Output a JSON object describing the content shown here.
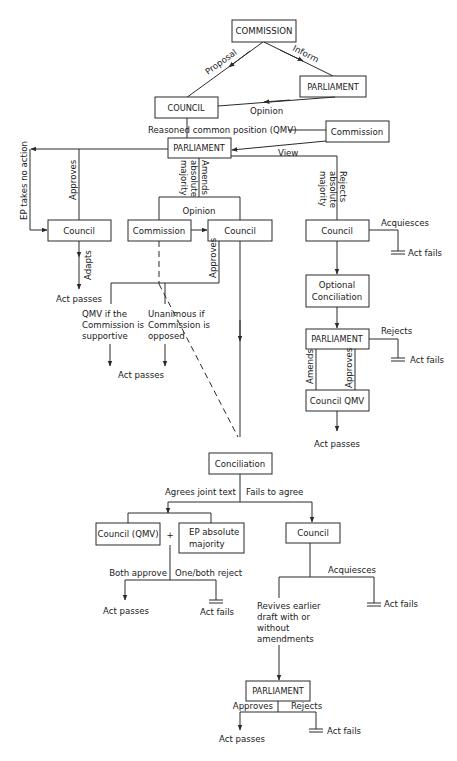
{
  "diagram": {
    "type": "flowchart",
    "title": "",
    "nodes": {
      "commission_top": "COMMISSION",
      "parliament_1": "PARLIAMENT",
      "council_1": "COUNCIL",
      "commission_side": "Commission",
      "parliament_2": "PARLIAMENT",
      "council_left": "Council",
      "commission_mid": "Commission",
      "council_mid": "Council",
      "council_right": "Council",
      "optional_conciliation": [
        "Optional",
        "Conciliation"
      ],
      "parliament_right": "PARLIAMENT",
      "council_qmv_right": "Council QMV",
      "conciliation": "Conciliation",
      "council_qmv_bottom": "Council (QMV)",
      "ep_absolute_majority": [
        "EP absolute",
        "majority"
      ],
      "council_bottom": "Council",
      "parliament_bottom": "PARLIAMENT"
    },
    "edge_labels": {
      "proposal": "Proposal",
      "inform": "Inform",
      "opinion_1": "Opinion",
      "reasoned_common_position": "Reasoned common position (QMV)",
      "view": "View",
      "ep_takes_no_action": "EP takes no action",
      "approves_left": "Approves",
      "amends_absolute_majority": [
        "Amends",
        "absolute",
        "majority"
      ],
      "rejects_absolute_majority": [
        "Rejects",
        "absolute",
        "majority"
      ],
      "opinion_2": "Opinion",
      "adapts": "Adapts",
      "approves_mid": "Approves",
      "acquiesces_right": "Acquiesces",
      "rejects_right": "Rejects",
      "amends_right": "Amends",
      "approves_right": "Approves",
      "agrees_joint_text": "Agrees joint text",
      "fails_to_agree": "Fails to agree",
      "plus": "+",
      "both_approve": "Both approve",
      "one_both_reject": "One/both reject",
      "acquiesces_bottom": "Acquiesces",
      "approves_bottom": "Approves",
      "rejects_bottom": "Rejects"
    },
    "notes": {
      "qmv_supportive": [
        "QMV if the",
        "Commission is",
        "supportive"
      ],
      "unanimous_opposed": [
        "Unanimous if",
        "Commission is",
        "opposed"
      ],
      "revives_draft": [
        "Revives earlier",
        "draft with or",
        "without",
        "amendments"
      ]
    },
    "outcomes": {
      "act_passes": "Act passes",
      "act_fails": "Act fails"
    }
  }
}
